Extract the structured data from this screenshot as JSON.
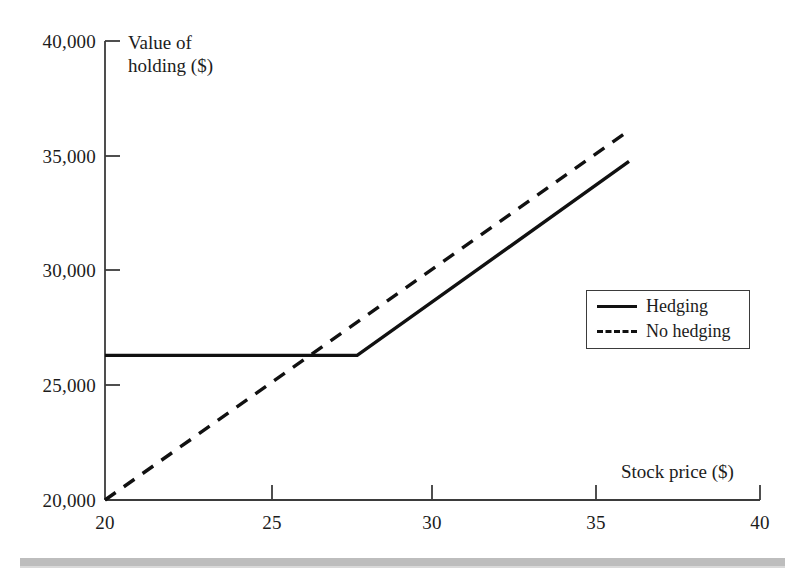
{
  "chart_data": {
    "type": "line",
    "title": "",
    "xlabel": "Stock price ($)",
    "ylabel": "Value of holding ($)",
    "xlim": [
      20,
      40
    ],
    "ylim": [
      20000,
      40000
    ],
    "xticks": [
      "20",
      "25",
      "30",
      "35",
      "40"
    ],
    "xtick_values": [
      20,
      25,
      30,
      35,
      40
    ],
    "yticks": [
      "20,000",
      "25,000",
      "30,000",
      "35,000",
      "40,000"
    ],
    "ytick_values": [
      20000,
      25000,
      30000,
      35000,
      40000
    ],
    "grid": false,
    "legend_position": "center-right",
    "series": [
      {
        "name": "Hedging",
        "style": "solid",
        "color": "#111111",
        "x": [
          20,
          27.7,
          36
        ],
        "values": [
          26300,
          26300,
          34750
        ]
      },
      {
        "name": "No hedging",
        "style": "dashed",
        "color": "#111111",
        "x": [
          20,
          36
        ],
        "values": [
          20000,
          36100
        ]
      }
    ]
  },
  "axes": {
    "y_title_line1": "Value of",
    "y_title_line2": "holding ($)",
    "x_title": "Stock price ($)"
  },
  "legend": {
    "items": [
      {
        "label": "Hedging",
        "style": "solid"
      },
      {
        "label": "No hedging",
        "style": "dashed"
      }
    ]
  },
  "colors": {
    "line": "#111111",
    "axis": "#3b3b3b",
    "text": "#1c1c1c",
    "band": "#bdbdbd",
    "background": "#ffffff"
  }
}
